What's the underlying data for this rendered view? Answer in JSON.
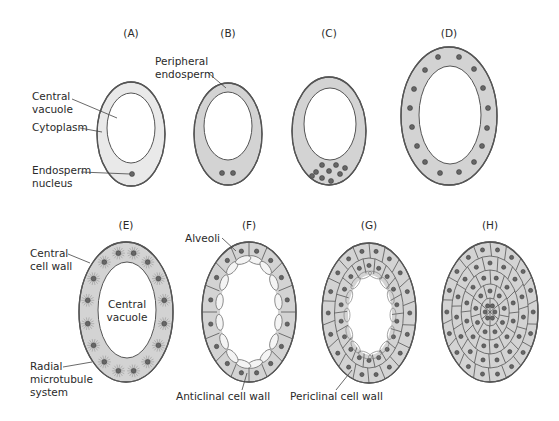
{
  "figure": {
    "colors": {
      "cytoplasm_light": "#e9e9e9",
      "cytoplasm": "#d3d3d3",
      "outline": "#555555",
      "nucleus": "#666666",
      "vacuole": "#ffffff"
    },
    "panels": [
      {
        "id": "A",
        "label": "(A)",
        "cx": 131,
        "cy": 134,
        "rx": 34,
        "ry": 52,
        "vcx": 131,
        "vcy": 128,
        "vrx": 24,
        "vry": 35,
        "light": true,
        "nuclei": [
          [
            132,
            174
          ]
        ]
      },
      {
        "id": "B",
        "label": "(B)",
        "cx": 228,
        "cy": 134,
        "rx": 34,
        "ry": 51,
        "vcx": 228,
        "vcy": 126,
        "vrx": 24,
        "vry": 34,
        "light": false,
        "nuclei": [
          [
            222,
            173
          ],
          [
            233,
            173
          ]
        ]
      },
      {
        "id": "C",
        "label": "(C)",
        "cx": 329,
        "cy": 131,
        "rx": 37,
        "ry": 54,
        "vcx": 330,
        "vcy": 124,
        "vrx": 26,
        "vry": 36,
        "light": false,
        "nuclei": [
          [
            322,
            165
          ],
          [
            336,
            165
          ],
          [
            345,
            168
          ],
          [
            316,
            172
          ],
          [
            329,
            171
          ],
          [
            340,
            174
          ],
          [
            312,
            176
          ],
          [
            322,
            178
          ],
          [
            331,
            181
          ]
        ]
      },
      {
        "id": "D",
        "label": "(D)",
        "cx": 449,
        "cy": 116,
        "rx": 48,
        "ry": 69,
        "vcx": 450,
        "vcy": 115,
        "vrx": 31,
        "vry": 49,
        "light": false,
        "nuclei": [
          [
            438,
            57
          ],
          [
            459,
            57
          ],
          [
            425,
            70
          ],
          [
            474,
            69
          ],
          [
            414,
            89
          ],
          [
            483,
            88
          ],
          [
            410,
            108
          ],
          [
            488,
            108
          ],
          [
            412,
            127
          ],
          [
            487,
            128
          ],
          [
            417,
            146
          ],
          [
            482,
            146
          ],
          [
            425,
            162
          ],
          [
            474,
            162
          ],
          [
            440,
            173
          ],
          [
            459,
            172
          ]
        ]
      },
      {
        "id": "E",
        "label": "(E)",
        "cx": 126,
        "cy": 312,
        "rx": 47,
        "ry": 70,
        "vcx": 127,
        "vcy": 310,
        "vrx": 29,
        "vry": 48,
        "light": false,
        "ring_count": 16,
        "radial": true
      },
      {
        "id": "F",
        "label": "(F)",
        "cx": 249,
        "cy": 312,
        "rx": 47,
        "ry": 70,
        "vcx": 249,
        "vcy": 312,
        "vrx": 27,
        "vry": 50,
        "light": false,
        "ring_count": 16,
        "alveoli": true
      },
      {
        "id": "G",
        "label": "(G)",
        "cx": 369,
        "cy": 313,
        "rx": 47,
        "ry": 70,
        "vcx": 370,
        "vcy": 315,
        "vrx": 22,
        "vry": 40,
        "light": false,
        "layers": 2
      },
      {
        "id": "H",
        "label": "(H)",
        "cx": 490,
        "cy": 312,
        "rx": 48,
        "ry": 70,
        "vcx": 490,
        "vcy": 312,
        "vrx": 0,
        "vry": 0,
        "light": false,
        "layers": 5
      }
    ],
    "annotations": [
      {
        "text": [
          "Central",
          "vacuole"
        ],
        "x": 32,
        "y": 100,
        "line": [
          [
            72,
            99
          ],
          [
            117,
            118
          ]
        ]
      },
      {
        "text": [
          "Cytoplasm"
        ],
        "x": 32,
        "y": 131,
        "line": [
          [
            80,
            128
          ],
          [
            102,
            132
          ]
        ]
      },
      {
        "text": [
          "Endosperm",
          "nucleus"
        ],
        "x": 32,
        "y": 174,
        "line": [
          [
            81,
            172
          ],
          [
            130,
            174
          ]
        ]
      },
      {
        "text": [
          "Peripheral",
          "endosperm"
        ],
        "x": 155,
        "y": 65,
        "line": [
          [
            207,
            72
          ],
          [
            226,
            88
          ]
        ]
      },
      {
        "text": [
          "Central",
          "cell wall"
        ],
        "x": 30,
        "y": 257,
        "line": [
          [
            68,
            254
          ],
          [
            90,
            263
          ]
        ]
      },
      {
        "text": [
          "Radial",
          "microtubule",
          "system"
        ],
        "x": 30,
        "y": 370,
        "line": [
          [
            63,
            367
          ],
          [
            92,
            362
          ]
        ]
      },
      {
        "text": [
          "Alveoli"
        ],
        "x": 185,
        "y": 242,
        "line": [
          [
            222,
            238
          ],
          [
            236,
            251
          ]
        ]
      },
      {
        "text": [
          "Anticlinal cell wall"
        ],
        "x": 176,
        "y": 400,
        "line": [
          [
            242,
            390
          ],
          [
            247,
            373
          ]
        ]
      },
      {
        "text": [
          "Periclinal cell wall"
        ],
        "x": 290,
        "y": 400,
        "line": [
          [
            336,
            390
          ],
          [
            352,
            370
          ]
        ]
      },
      {
        "text": [
          "Central",
          "vacuole"
        ],
        "x": 127,
        "y": 308,
        "anchor": "middle"
      }
    ]
  }
}
